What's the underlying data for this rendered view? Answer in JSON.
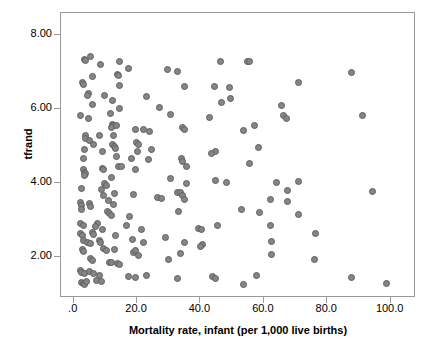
{
  "chart_data": {
    "type": "scatter",
    "title": "",
    "xlabel": "Mortality rate, infant (per 1,000 live births)",
    "ylabel": "tfrand",
    "xlim": [
      -4.0,
      108.0
    ],
    "ylim": [
      0.9,
      8.6
    ],
    "xticks": [
      0,
      20,
      40,
      60,
      80,
      100
    ],
    "xtick_labels": [
      ".0",
      "20.0",
      "40.0",
      "60.0",
      "80.0",
      "100.0"
    ],
    "yticks": [
      2,
      4,
      6,
      8
    ],
    "ytick_labels": [
      "2.00",
      "4.00",
      "6.00",
      "8.00"
    ],
    "grid": false,
    "legend": null,
    "marker": {
      "shape": "circle",
      "fill": "#858585",
      "edge": "#5e5e5e",
      "size_px": 7
    },
    "frame_color": "#9a9a9a",
    "background": "#ffffff",
    "n_points": 188,
    "points": [
      [
        3.4,
        7.35
      ],
      [
        3.6,
        7.33
      ],
      [
        5.2,
        7.42
      ],
      [
        8.6,
        7.22
      ],
      [
        14.6,
        7.3
      ],
      [
        13.9,
        6.95
      ],
      [
        14.2,
        6.92
      ],
      [
        17.4,
        7.11
      ],
      [
        29.5,
        7.07
      ],
      [
        32.8,
        7.02
      ],
      [
        46.3,
        7.3
      ],
      [
        54.8,
        7.28
      ],
      [
        55.6,
        7.28
      ],
      [
        87.7,
        7.0
      ],
      [
        5.8,
        6.88
      ],
      [
        2.7,
        6.72
      ],
      [
        3.1,
        6.66
      ],
      [
        14.6,
        6.64
      ],
      [
        35.1,
        6.62
      ],
      [
        44.4,
        6.62
      ],
      [
        49.2,
        6.58
      ],
      [
        70.8,
        6.72
      ],
      [
        4.6,
        6.43
      ],
      [
        4.5,
        6.36
      ],
      [
        9.8,
        6.38
      ],
      [
        12.1,
        6.23
      ],
      [
        23.0,
        6.34
      ],
      [
        46.6,
        6.19
      ],
      [
        49.5,
        6.3
      ],
      [
        65.7,
        6.1
      ],
      [
        5.9,
        6.13
      ],
      [
        14.4,
        6.02
      ],
      [
        27.1,
        6.04
      ],
      [
        2.1,
        5.82
      ],
      [
        4.7,
        5.76
      ],
      [
        11.5,
        5.88
      ],
      [
        30.6,
        5.86
      ],
      [
        42.9,
        5.79
      ],
      [
        66.2,
        5.82
      ],
      [
        67.0,
        5.76
      ],
      [
        91.0,
        5.83
      ],
      [
        12.3,
        5.6
      ],
      [
        12.5,
        5.56
      ],
      [
        11.9,
        5.5
      ],
      [
        13.4,
        5.55
      ],
      [
        19.6,
        5.45
      ],
      [
        22.0,
        5.44
      ],
      [
        23.8,
        5.4
      ],
      [
        34.4,
        5.52
      ],
      [
        34.9,
        5.44
      ],
      [
        53.5,
        5.43
      ],
      [
        57.2,
        5.56
      ],
      [
        3.8,
        5.28
      ],
      [
        3.6,
        5.22
      ],
      [
        4.9,
        5.16
      ],
      [
        8.3,
        5.3
      ],
      [
        12.6,
        5.28
      ],
      [
        12.1,
        5.05
      ],
      [
        6.4,
        5.05
      ],
      [
        19.9,
        5.11
      ],
      [
        20.3,
        5.04
      ],
      [
        58.3,
        4.96
      ],
      [
        13.0,
        4.98
      ],
      [
        13.3,
        4.93
      ],
      [
        24.6,
        4.92
      ],
      [
        3.3,
        4.92
      ],
      [
        9.2,
        4.86
      ],
      [
        20.2,
        4.86
      ],
      [
        44.8,
        4.85
      ],
      [
        43.6,
        4.8
      ],
      [
        3.2,
        4.67
      ],
      [
        13.6,
        4.72
      ],
      [
        18.3,
        4.68
      ],
      [
        23.5,
        4.63
      ],
      [
        34.0,
        4.68
      ],
      [
        34.3,
        4.6
      ],
      [
        35.6,
        4.46
      ],
      [
        55.4,
        4.54
      ],
      [
        3.0,
        4.36
      ],
      [
        3.4,
        4.3
      ],
      [
        3.6,
        4.26
      ],
      [
        3.3,
        4.2
      ],
      [
        9.1,
        4.41
      ],
      [
        9.5,
        4.37
      ],
      [
        14.0,
        4.45
      ],
      [
        15.2,
        4.44
      ],
      [
        19.4,
        4.38
      ],
      [
        11.9,
        4.16
      ],
      [
        30.6,
        4.13
      ],
      [
        44.9,
        4.08
      ],
      [
        48.2,
        4.02
      ],
      [
        70.9,
        4.05
      ],
      [
        9.7,
        4.0
      ],
      [
        10.2,
        3.93
      ],
      [
        35.5,
        3.99
      ],
      [
        63.9,
        4.03
      ],
      [
        2.6,
        3.87
      ],
      [
        8.8,
        3.83
      ],
      [
        13.0,
        3.72
      ],
      [
        9.3,
        3.67
      ],
      [
        18.8,
        3.7
      ],
      [
        26.5,
        3.62
      ],
      [
        27.8,
        3.6
      ],
      [
        32.6,
        3.74
      ],
      [
        33.6,
        3.76
      ],
      [
        34.4,
        3.68
      ],
      [
        67.4,
        3.8
      ],
      [
        94.2,
        3.77
      ],
      [
        2.3,
        3.49
      ],
      [
        2.5,
        3.4
      ],
      [
        5.0,
        3.44
      ],
      [
        5.3,
        3.37
      ],
      [
        11.0,
        3.53
      ],
      [
        12.5,
        3.43
      ],
      [
        35.1,
        3.55
      ],
      [
        62.0,
        3.57
      ],
      [
        67.6,
        3.52
      ],
      [
        2.6,
        3.28
      ],
      [
        10.6,
        3.25
      ],
      [
        11.4,
        3.17
      ],
      [
        11.8,
        3.14
      ],
      [
        17.6,
        3.1
      ],
      [
        33.0,
        3.24
      ],
      [
        52.8,
        3.28
      ],
      [
        58.6,
        3.21
      ],
      [
        70.9,
        3.15
      ],
      [
        2.2,
        2.92
      ],
      [
        3.0,
        2.86
      ],
      [
        7.4,
        2.9
      ],
      [
        7.0,
        2.83
      ],
      [
        9.0,
        2.74
      ],
      [
        16.6,
        2.85
      ],
      [
        39.4,
        2.78
      ],
      [
        40.2,
        2.75
      ],
      [
        45.5,
        2.85
      ],
      [
        62.2,
        2.87
      ],
      [
        2.2,
        2.64
      ],
      [
        2.7,
        2.58
      ],
      [
        5.9,
        2.68
      ],
      [
        6.2,
        2.62
      ],
      [
        13.2,
        2.58
      ],
      [
        21.3,
        2.75
      ],
      [
        76.3,
        2.63
      ],
      [
        3.0,
        2.46
      ],
      [
        4.5,
        2.41
      ],
      [
        5.4,
        2.36
      ],
      [
        8.1,
        2.45
      ],
      [
        8.5,
        2.41
      ],
      [
        18.6,
        2.48
      ],
      [
        22.1,
        2.4
      ],
      [
        29.1,
        2.53
      ],
      [
        35.1,
        2.4
      ],
      [
        40.5,
        2.34
      ],
      [
        40.1,
        2.29
      ],
      [
        62.3,
        2.44
      ],
      [
        2.7,
        2.21
      ],
      [
        3.1,
        2.16
      ],
      [
        9.4,
        2.24
      ],
      [
        10.2,
        2.18
      ],
      [
        12.8,
        2.2
      ],
      [
        18.9,
        2.13
      ],
      [
        19.4,
        2.18
      ],
      [
        20.3,
        2.05
      ],
      [
        33.7,
        2.1
      ],
      [
        62.5,
        2.08
      ],
      [
        5.3,
        1.98
      ],
      [
        5.8,
        1.92
      ],
      [
        11.2,
        1.87
      ],
      [
        12.0,
        1.85
      ],
      [
        13.9,
        1.82
      ],
      [
        14.5,
        1.8
      ],
      [
        30.0,
        1.95
      ],
      [
        76.1,
        1.95
      ],
      [
        2.2,
        1.63
      ],
      [
        2.5,
        1.59
      ],
      [
        3.5,
        1.55
      ],
      [
        4.9,
        1.62
      ],
      [
        6.4,
        1.56
      ],
      [
        8.0,
        1.5
      ],
      [
        17.4,
        1.49
      ],
      [
        19.6,
        1.46
      ],
      [
        23.0,
        1.51
      ],
      [
        32.6,
        1.43
      ],
      [
        43.9,
        1.48
      ],
      [
        44.7,
        1.44
      ],
      [
        57.7,
        1.51
      ],
      [
        87.6,
        1.46
      ],
      [
        2.6,
        1.33
      ],
      [
        3.0,
        1.3
      ],
      [
        3.4,
        1.27
      ],
      [
        4.1,
        1.34
      ],
      [
        7.3,
        1.38
      ],
      [
        8.9,
        1.35
      ],
      [
        53.6,
        1.26
      ],
      [
        98.6,
        1.28
      ]
    ]
  }
}
